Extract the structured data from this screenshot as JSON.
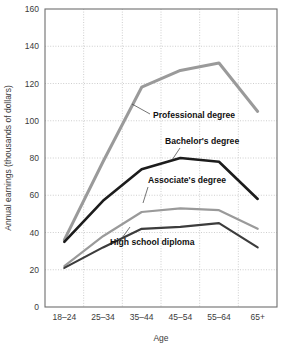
{
  "chart_data": {
    "type": "line",
    "title": "",
    "xlabel": "Age",
    "ylabel": "Annual earnings (thousands of dollars)",
    "categories": [
      "18–24",
      "25–34",
      "35–44",
      "45–54",
      "55–64",
      "65+"
    ],
    "ylim": [
      0,
      160
    ],
    "yticks": [
      0,
      20,
      40,
      60,
      80,
      100,
      120,
      140,
      160
    ],
    "grid": true,
    "legend_position": "inline-labels",
    "series": [
      {
        "name": "Professional degree",
        "color": "#9a9a9a",
        "width": 3.0,
        "values": [
          36,
          78,
          118,
          127,
          131,
          105
        ]
      },
      {
        "name": "Bachelor's degree",
        "color": "#1c1c1c",
        "width": 2.6,
        "values": [
          35,
          57,
          74,
          80,
          78,
          58
        ]
      },
      {
        "name": "Associate's degree",
        "color": "#9a9a9a",
        "width": 2.2,
        "values": [
          22,
          38,
          51,
          53,
          52,
          42
        ]
      },
      {
        "name": "High school diploma",
        "color": "#3c3c3c",
        "width": 2.2,
        "values": [
          21,
          32,
          42,
          43,
          45,
          32
        ]
      }
    ],
    "annotations": [
      {
        "text": "Professional degree",
        "x": 153,
        "y": 118,
        "anchor": "start",
        "leader": [
          [
            150,
            114
          ],
          [
            132,
            104
          ]
        ]
      },
      {
        "text": "Bachelor's degree",
        "x": 165,
        "y": 144,
        "anchor": "start",
        "leader": [
          [
            180,
            148
          ],
          [
            172,
            160
          ]
        ]
      },
      {
        "text": "Associate's degree",
        "x": 148,
        "y": 183,
        "anchor": "start",
        "leader": [
          [
            148,
            187
          ],
          [
            143,
            203
          ]
        ]
      },
      {
        "text": "High school diploma",
        "x": 110,
        "y": 245,
        "anchor": "start",
        "leader": [
          [
            122,
            238
          ],
          [
            130,
            227
          ]
        ]
      }
    ]
  },
  "layout": {
    "plot_left": 45,
    "plot_right": 277,
    "plot_top": 9,
    "plot_bottom": 307
  }
}
